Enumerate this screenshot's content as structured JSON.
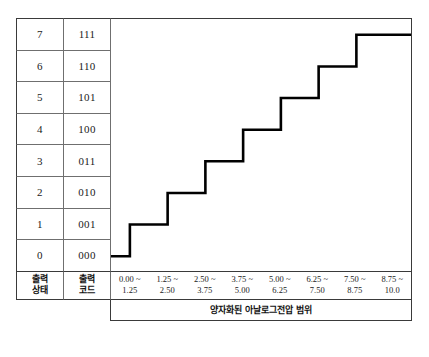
{
  "table": {
    "header": {
      "state": "출력\n상태",
      "state_l1": "출력",
      "state_l2": "상태",
      "code_l1": "출력",
      "code_l2": "코드"
    },
    "rows": [
      {
        "state": "7",
        "code": "111"
      },
      {
        "state": "6",
        "code": "110"
      },
      {
        "state": "5",
        "code": "101"
      },
      {
        "state": "4",
        "code": "100"
      },
      {
        "state": "3",
        "code": "011"
      },
      {
        "state": "2",
        "code": "010"
      },
      {
        "state": "1",
        "code": "001"
      },
      {
        "state": "0",
        "code": "000"
      }
    ]
  },
  "xaxis": {
    "ticks": [
      {
        "top": "0.00 ~",
        "bottom": "1.25"
      },
      {
        "top": "1.25 ~",
        "bottom": "2.50"
      },
      {
        "top": "2.50 ~",
        "bottom": "3.75"
      },
      {
        "top": "3.75 ~",
        "bottom": "5.00"
      },
      {
        "top": "5.00 ~",
        "bottom": "6.25"
      },
      {
        "top": "6.25 ~",
        "bottom": "7.50"
      },
      {
        "top": "7.50 ~",
        "bottom": "8.75"
      },
      {
        "top": "8.75 ~",
        "bottom": "10.0"
      }
    ],
    "caption": "양자화된 아날로그전압 범위"
  },
  "chart_data": {
    "type": "line",
    "title": "",
    "xlabel": "양자화된 아날로그전압 범위",
    "ylabel": "출력 상태 / 출력 코드",
    "step_style": "staircase",
    "categories": [
      "0.00 ~ 1.25",
      "1.25 ~ 2.50",
      "2.50 ~ 3.75",
      "3.75 ~ 5.00",
      "5.00 ~ 6.25",
      "6.25 ~ 7.50",
      "7.50 ~ 8.75",
      "8.75 ~ 10.0"
    ],
    "values": [
      0,
      1,
      2,
      3,
      4,
      5,
      6,
      7
    ],
    "codes": [
      "000",
      "001",
      "010",
      "011",
      "100",
      "101",
      "110",
      "111"
    ],
    "x_bin_edges": [
      0.0,
      1.25,
      2.5,
      3.75,
      5.0,
      6.25,
      7.5,
      8.75,
      10.0
    ],
    "ylim": [
      0,
      7
    ],
    "xlim": [
      0,
      10
    ],
    "grid": false,
    "legend": "none",
    "line_color": "#000000",
    "line_width": 2.6
  },
  "colors": {
    "frame": "#3a3a3a",
    "grid_line": "#6f6f6f",
    "curve": "#000000",
    "background": "#ffffff"
  }
}
